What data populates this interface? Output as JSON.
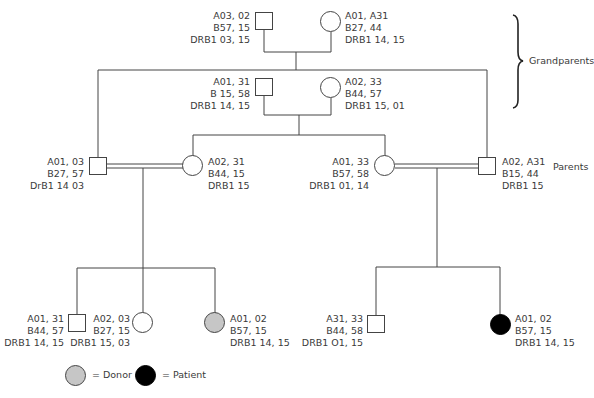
{
  "generation_labels": {
    "grandparents": "Grandparents",
    "parents": "Parents"
  },
  "grandparents": {
    "paternal_side": {
      "male": {
        "lines": [
          "A03, 02",
          "B57, 15",
          "DRB1 03, 15"
        ]
      },
      "female": {
        "lines": [
          "A01, A31",
          "B27, 44",
          "DRB1 14, 15"
        ]
      }
    },
    "maternal_side": {
      "male": {
        "lines": [
          "A01, 31",
          "B 15, 58",
          "DRB1 14, 15"
        ]
      },
      "female": {
        "lines": [
          "A02,  33",
          "B44,  57",
          "DRB1 15, 01"
        ]
      }
    }
  },
  "parents": {
    "left_couple": {
      "male": {
        "lines": [
          "A01, 03",
          "B27, 57",
          "DrB1 14 03"
        ]
      },
      "female": {
        "lines": [
          "A02, 31",
          "B44, 15",
          "DRB1 15"
        ]
      }
    },
    "right_couple": {
      "female": {
        "lines": [
          "A01, 33",
          "B57, 58",
          "DRB1 01, 14"
        ]
      },
      "male": {
        "lines": [
          "A02, A31",
          "B15, 44",
          "DRB1 15"
        ]
      }
    }
  },
  "children": {
    "left_family": [
      {
        "sex": "male",
        "status": "none",
        "lines": [
          "A01, 31",
          "B44, 57",
          "DRB1 14, 15"
        ]
      },
      {
        "sex": "female",
        "status": "none",
        "lines": [
          "A02, 03",
          "B27, 15",
          "DRB1 15, 03"
        ]
      },
      {
        "sex": "female",
        "status": "donor",
        "lines": [
          "A01, 02",
          "B57, 15",
          "DRB1 14, 15"
        ]
      }
    ],
    "right_family": [
      {
        "sex": "male",
        "status": "none",
        "lines": [
          "A31, 33",
          "B44, 58",
          "DRB1 O1, 15"
        ]
      },
      {
        "sex": "female",
        "status": "patient",
        "lines": [
          "A01, 02",
          "B57, 15",
          "DRB1 14, 15"
        ]
      }
    ]
  },
  "legend": {
    "donor": {
      "label": "= Donor",
      "color": "#c6c6c6"
    },
    "patient": {
      "label": "= Patient",
      "color": "#000000"
    }
  },
  "colors": {
    "line": "#444444",
    "text": "#3a3a3a",
    "background": "#ffffff"
  }
}
